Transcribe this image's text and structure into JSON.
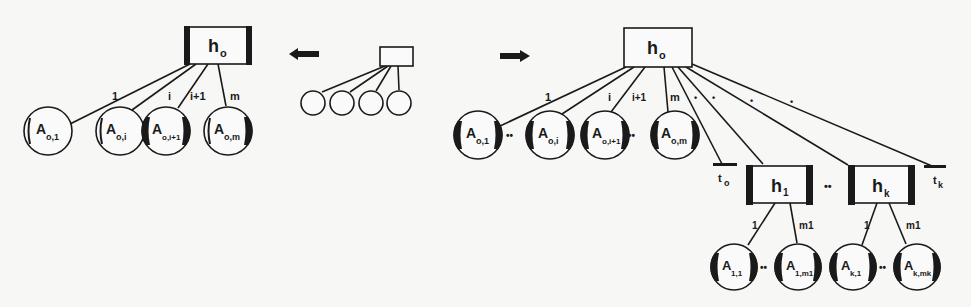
{
  "diagram": {
    "left_tree": {
      "root": {
        "label": "h",
        "sub": "o"
      },
      "edges": [
        "1",
        "i",
        "i+1",
        "m"
      ],
      "leaves": [
        {
          "label": "A",
          "sub": "o,1"
        },
        {
          "label": "A",
          "sub": "o,i"
        },
        {
          "label": "A",
          "sub": "o,i+1"
        },
        {
          "label": "A",
          "sub": "o,m"
        }
      ]
    },
    "arrows": {
      "left": "left-arrow",
      "right": "right-arrow"
    },
    "middle_tree": {
      "leaf_count": 4
    },
    "right_tree": {
      "root": {
        "label": "h",
        "sub": "o"
      },
      "edges": [
        "1",
        "i",
        "i+1",
        "m"
      ],
      "dots": [
        "•",
        "•",
        "•",
        "•"
      ],
      "leaves": [
        {
          "label": "A",
          "sub": "o,1"
        },
        {
          "label": "A",
          "sub": "o,i"
        },
        {
          "label": "A",
          "sub": "o,i+1"
        },
        {
          "label": "A",
          "sub": "o,m"
        }
      ],
      "ellipsis": "••",
      "terminals": [
        {
          "label": "t",
          "sub": "o"
        },
        {
          "label": "t",
          "sub": "k"
        }
      ],
      "subtrees": [
        {
          "root": {
            "label": "h",
            "sub": "1"
          },
          "edges": [
            "1",
            "m1"
          ],
          "leaves": [
            {
              "label": "A",
              "sub": "1,1"
            },
            {
              "label": "A",
              "sub": "1,m1"
            }
          ]
        },
        {
          "root": {
            "label": "h",
            "sub": "k"
          },
          "edges": [
            "1",
            "m1"
          ],
          "leaves": [
            {
              "label": "A",
              "sub": "k,1"
            },
            {
              "label": "A",
              "sub": "k,mk"
            }
          ]
        }
      ]
    }
  }
}
